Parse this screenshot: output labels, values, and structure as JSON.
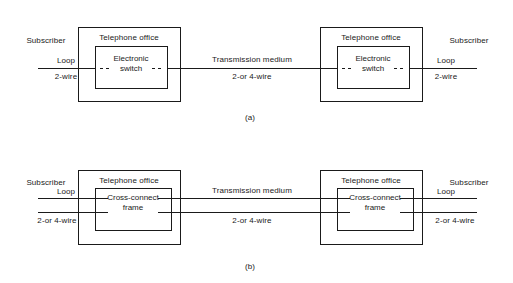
{
  "figure": {
    "background_color": "#ffffff",
    "line_color": "#1a1a1a",
    "text_color": "#1a1a1a"
  },
  "panels": [
    {
      "tag": "(a)",
      "description": "Electronic switch based telephone offices connected by transmission medium",
      "left_subscriber": {
        "title": "Subscriber",
        "loop_label": "Loop",
        "wire_label": "2-wire"
      },
      "right_subscriber": {
        "title": "Subscriber",
        "loop_label": "Loop",
        "wire_label": "2-wire"
      },
      "left_office": {
        "title": "Telephone office",
        "inner_line1": "Electronic",
        "inner_line2": "switch"
      },
      "right_office": {
        "title": "Telephone office",
        "inner_line1": "Electronic",
        "inner_line2": "switch"
      },
      "link": {
        "title": "Transmission medium",
        "wire_label": "2-or 4-wire"
      }
    },
    {
      "tag": "(b)",
      "description": "Cross-connect frame based telephone offices connected by transmission medium",
      "left_subscriber": {
        "title": "Subscriber",
        "loop_label": "Loop",
        "wire_label": "2-or 4-wire"
      },
      "right_subscriber": {
        "title": "Subscriber",
        "loop_label": "Loop",
        "wire_label": "2-or 4-wire"
      },
      "left_office": {
        "title": "Telephone office",
        "inner_line1": "Cross-connect",
        "inner_line2": "frame"
      },
      "right_office": {
        "title": "Telephone office",
        "inner_line1": "Cross-connect",
        "inner_line2": "frame"
      },
      "link": {
        "title": "Transmission medium",
        "wire_label": "2-or 4-wire"
      }
    }
  ]
}
